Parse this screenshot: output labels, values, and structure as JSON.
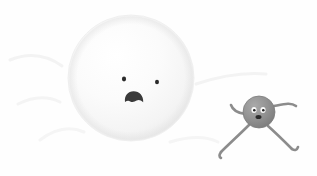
{
  "scene": {
    "title": "Cartoon illustration: large pale worried ball face and small gray running ball character",
    "width": 317,
    "height": 176,
    "background_color": "#fefefe",
    "caption": ""
  },
  "characters": [
    {
      "id": "big-ball",
      "name": "large-pale-ball-character",
      "description": "Very large off-white sphere with a worried face",
      "body": {
        "shape": "circle",
        "center_x": 131,
        "center_y": 78,
        "radius": 63,
        "fill_color": "#f7f7f7",
        "highlight_color": "#ffffff",
        "shade_color": "#e6e6e6",
        "outline_color": "#efefef"
      },
      "face": {
        "eyes": [
          {
            "name": "left-eye",
            "cx": 124,
            "cy": 79,
            "rx": 2.1,
            "ry": 2.4,
            "color": "#2b2b2b"
          },
          {
            "name": "right-eye",
            "cx": 157,
            "cy": 82,
            "rx": 2.0,
            "ry": 2.3,
            "color": "#2b2b2b"
          }
        ],
        "mouth": {
          "name": "worried-open-mouth",
          "shape": "dome",
          "cx": 134,
          "cy": 97,
          "width": 19,
          "height": 11,
          "color": "#3a3a3a"
        },
        "expression": "worried"
      }
    },
    {
      "id": "small-ball",
      "name": "small-gray-running-character",
      "description": "Small gray sphere with stick arms and legs, running to the right",
      "body": {
        "shape": "circle",
        "center_x": 259,
        "center_y": 112,
        "radius": 16,
        "fill_color": "#8f8f8f",
        "highlight_color": "#a8a8a8",
        "shade_color": "#6f6f6f",
        "outline_color": "#7d7d7d"
      },
      "face": {
        "eyes": [
          {
            "name": "left-eye",
            "cx": 254,
            "cy": 110,
            "rx": 2.6,
            "ry": 3.0,
            "sclera_color": "#fafafa",
            "pupil_color": "#262626",
            "pupil_r": 1.3
          },
          {
            "name": "right-eye",
            "cx": 263,
            "cy": 110,
            "rx": 2.6,
            "ry": 3.0,
            "sclera_color": "#fafafa",
            "pupil_color": "#262626",
            "pupil_r": 1.3
          }
        ],
        "mouth": {
          "name": "open-smile-mouth",
          "shape": "small-oval",
          "cx": 258.5,
          "cy": 117,
          "width": 6,
          "height": 4,
          "color": "#2b2b2b"
        },
        "expression": "happy"
      },
      "limbs": {
        "stroke_color": "#8c8c8c",
        "stroke_width": 2.6,
        "arms": [
          {
            "name": "left-arm-back",
            "path": "M 245 114 C 238 113 233 111 231 105"
          },
          {
            "name": "right-arm-forward",
            "path": "M 274 106 C 284 104 291 102 296 106"
          }
        ],
        "legs": [
          {
            "name": "left-leg-trailing",
            "path": "M 249 125 C 240 134 229 144 221 152"
          },
          {
            "name": "right-leg-leading",
            "path": "M 268 126 C 277 134 285 142 292 149"
          }
        ],
        "feet": [
          {
            "name": "left-foot",
            "path": "M 221 152 C 219 155 219 157 221 158"
          },
          {
            "name": "right-foot",
            "path": "M 292 149 C 295 151 297 150 298 147"
          }
        ]
      }
    }
  ],
  "background_marks": [
    {
      "name": "faint-stroke-left-upper",
      "path": "M 10 60 C 30 52 48 56 62 66",
      "color": "#f3f3f3",
      "width": 3
    },
    {
      "name": "faint-stroke-left-lower",
      "path": "M 18 104 C 34 96 48 96 60 102",
      "color": "#f4f4f4",
      "width": 3
    },
    {
      "name": "faint-stroke-bottom-left",
      "path": "M 40 140 C 56 128 70 126 84 132",
      "color": "#f5f5f5",
      "width": 3
    },
    {
      "name": "faint-stroke-right-upper",
      "path": "M 196 84 C 220 76 244 72 266 74",
      "color": "#f3f3f3",
      "width": 3
    },
    {
      "name": "faint-stroke-bottom-right",
      "path": "M 170 142 C 190 136 206 136 218 142",
      "color": "#f5f5f5",
      "width": 3
    }
  ],
  "palette": {
    "background": "#fefefe",
    "big_ball": "#f7f7f7",
    "small_ball": "#8f8f8f",
    "ink": "#2b2b2b",
    "faint_line": "#f4f4f4"
  }
}
